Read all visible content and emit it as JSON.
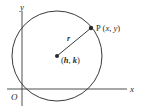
{
  "diagram": {
    "type": "circle-equation-figure",
    "axes": {
      "x_label": "x",
      "y_label": "y",
      "origin_label": "O"
    },
    "circle": {
      "center_label_open": "(",
      "center_h": "h",
      "center_sep": ", ",
      "center_k": "k",
      "center_label_close": ")",
      "radius_label": "r"
    },
    "point": {
      "name": "P",
      "coords_open": " (",
      "coord_x": "x",
      "coords_sep": ", ",
      "coord_y": "y",
      "coords_close": ")"
    },
    "colors": {
      "stroke": "#3a3a3a",
      "text": "#2a2a2a",
      "background": "#ffffff"
    }
  }
}
